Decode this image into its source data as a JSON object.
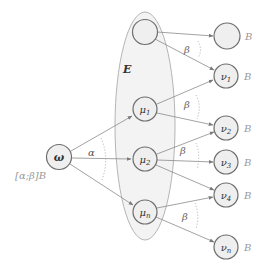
{
  "colors": {
    "node_fill": "#efefef",
    "node_stroke": "#6e6e6e",
    "edge": "#8a8a8a",
    "ellipse_fill": "#f3f3f3",
    "ellipse_stroke": "#b5b5b5",
    "arc_dotted": "#b0b0b0",
    "text": "#333333",
    "label_muted": "#9a9a9a"
  },
  "ellipse": {
    "label": "E"
  },
  "source": {
    "label": "ω",
    "annotation": "[α;β]B",
    "angle_label": "α"
  },
  "middle_nodes": [
    {
      "id": "m0",
      "label": ""
    },
    {
      "id": "m1",
      "label": "μ",
      "sub": "1"
    },
    {
      "id": "m2",
      "label": "μ",
      "sub": "2"
    },
    {
      "id": "mn",
      "label": "μ",
      "sub": "n"
    }
  ],
  "right_nodes": [
    {
      "id": "r0",
      "label": "",
      "sub": "",
      "tag": "B"
    },
    {
      "id": "r1",
      "label": "ν",
      "sub": "1",
      "tag": "B"
    },
    {
      "id": "r2",
      "label": "ν",
      "sub": "2",
      "tag": "B"
    },
    {
      "id": "r3",
      "label": "ν",
      "sub": "3",
      "tag": "B"
    },
    {
      "id": "r4",
      "label": "ν",
      "sub": "4",
      "tag": "B"
    },
    {
      "id": "rn",
      "label": "ν",
      "sub": "n",
      "tag": "B"
    }
  ],
  "beta_labels": [
    "β",
    "β",
    "β",
    "β"
  ]
}
